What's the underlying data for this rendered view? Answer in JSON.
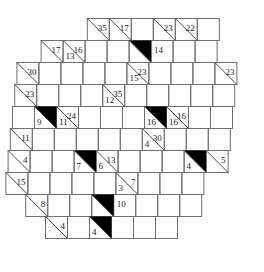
{
  "puzzle": {
    "type": "kakuro",
    "title": "Kakuro puzzle grid",
    "shape": "rhombus",
    "rows": 10,
    "cols": 10,
    "cell_size": 22,
    "colors": {
      "grid_line": "#6f6f6f",
      "diagonal": "#4a4a4a",
      "clue_text": "#1a1a1a",
      "block_fill": "#000000",
      "cell_fill": "#ffffff",
      "background": "#ffffff"
    },
    "clues": [
      {
        "id": "c-r0c3",
        "row": 0,
        "col": 3,
        "across": "35",
        "down": "",
        "black": false
      },
      {
        "id": "c-r0c4",
        "row": 0,
        "col": 4,
        "across": "17",
        "down": "",
        "black": false
      },
      {
        "id": "c-r0c6",
        "row": 0,
        "col": 6,
        "across": "23",
        "down": "",
        "black": false
      },
      {
        "id": "c-r0c7",
        "row": 0,
        "col": 7,
        "across": "22",
        "down": "",
        "black": false
      },
      {
        "id": "c-r1c1",
        "row": 1,
        "col": 1,
        "across": "17",
        "down": "",
        "black": false
      },
      {
        "id": "c-r1c2",
        "row": 1,
        "col": 2,
        "across": "16",
        "down": "13",
        "black": false
      },
      {
        "id": "c-r1c5",
        "row": 1,
        "col": 5,
        "across": "14",
        "down": "",
        "black": true
      },
      {
        "id": "c-r1c9",
        "row": 1,
        "col": 9,
        "across": "29",
        "down": "",
        "black": false
      },
      {
        "id": "c-r2c0",
        "row": 2,
        "col": 0,
        "across": "30",
        "down": "",
        "black": false
      },
      {
        "id": "c-r2c5",
        "row": 2,
        "col": 5,
        "across": "23",
        "down": "15",
        "black": false
      },
      {
        "id": "c-r2c9",
        "row": 2,
        "col": 9,
        "across": "23",
        "down": "",
        "black": false
      },
      {
        "id": "c-r3c0",
        "row": 3,
        "col": 0,
        "across": "23",
        "down": "",
        "black": false
      },
      {
        "id": "c-r3c4",
        "row": 3,
        "col": 4,
        "across": "35",
        "down": "12",
        "black": false
      },
      {
        "id": "c-r4c1",
        "row": 4,
        "col": 1,
        "across": "",
        "down": "9",
        "black": true
      },
      {
        "id": "c-r4c2",
        "row": 4,
        "col": 2,
        "across": "24",
        "down": "11",
        "black": false
      },
      {
        "id": "c-r4c6",
        "row": 4,
        "col": 6,
        "across": "",
        "down": "16",
        "black": true
      },
      {
        "id": "c-r4c7",
        "row": 4,
        "col": 7,
        "across": "16",
        "down": "16",
        "black": false
      },
      {
        "id": "c-r5c0",
        "row": 5,
        "col": 0,
        "across": "11",
        "down": "",
        "black": false
      },
      {
        "id": "c-r5c6",
        "row": 5,
        "col": 6,
        "across": "30",
        "down": "4",
        "black": false
      },
      {
        "id": "c-r6c0",
        "row": 6,
        "col": 0,
        "across": "4",
        "down": "",
        "black": false
      },
      {
        "id": "c-r6c3",
        "row": 6,
        "col": 3,
        "across": "",
        "down": "7",
        "black": true
      },
      {
        "id": "c-r6c4",
        "row": 6,
        "col": 4,
        "across": "13",
        "down": "6",
        "black": false
      },
      {
        "id": "c-r6c8",
        "row": 6,
        "col": 8,
        "across": "",
        "down": "4",
        "black": true
      },
      {
        "id": "c-r6c9",
        "row": 6,
        "col": 9,
        "across": "5",
        "down": "",
        "black": false
      },
      {
        "id": "c-r7c0",
        "row": 7,
        "col": 0,
        "across": "15",
        "down": "",
        "black": false
      },
      {
        "id": "c-r7c5",
        "row": 7,
        "col": 5,
        "across": "7",
        "down": "3",
        "black": false
      },
      {
        "id": "c-r8c1",
        "row": 8,
        "col": 1,
        "across": "8",
        "down": "",
        "black": false
      },
      {
        "id": "c-r8c4",
        "row": 8,
        "col": 4,
        "across": "10",
        "down": "",
        "black": true
      },
      {
        "id": "c-r9c2",
        "row": 9,
        "col": 2,
        "across": "4",
        "down": "",
        "black": false
      },
      {
        "id": "c-r9c4",
        "row": 9,
        "col": 4,
        "across": "",
        "down": "4",
        "black": true
      }
    ],
    "row_offsets": [
      9,
      8,
      7,
      6,
      5,
      4,
      3,
      2,
      1,
      0
    ],
    "row_lengths": [
      6,
      8,
      10,
      10,
      10,
      10,
      10,
      9,
      8,
      6
    ],
    "row_starts": [
      3,
      1,
      0,
      0,
      0,
      0,
      0,
      0,
      1,
      2
    ]
  }
}
